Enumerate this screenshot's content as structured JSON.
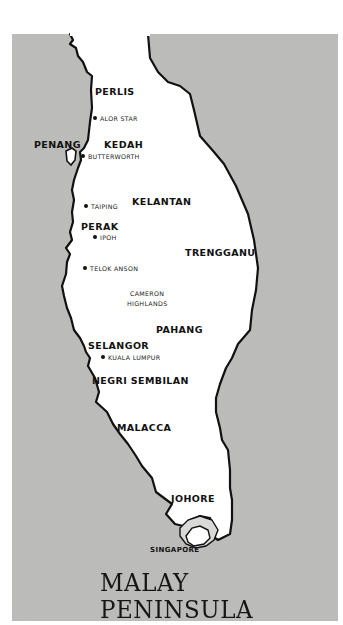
{
  "map": {
    "title": "MALAY PENINSULA",
    "colors": {
      "sea": "#b9b9b7",
      "land": "#ffffff",
      "coastline": "#111111",
      "text": "#111111"
    },
    "states": [
      {
        "name": "PERLIS"
      },
      {
        "name": "KEDAH"
      },
      {
        "name": "PENANG"
      },
      {
        "name": "KELANTAN"
      },
      {
        "name": "PERAK"
      },
      {
        "name": "TRENGGANU"
      },
      {
        "name": "PAHANG"
      },
      {
        "name": "SELANGOR"
      },
      {
        "name": "NEGRI SEMBILAN"
      },
      {
        "name": "MALACCA"
      },
      {
        "name": "JOHORE"
      },
      {
        "name": "SINGAPORE"
      }
    ],
    "towns": [
      {
        "name": "ALOR STAR"
      },
      {
        "name": "BUTTERWORTH"
      },
      {
        "name": "TAIPING"
      },
      {
        "name": "IPOH"
      },
      {
        "name": "TELOK ANSON"
      },
      {
        "name": "KUALA LUMPUR"
      }
    ],
    "regions": [
      {
        "name": "CAMERON",
        "name2": "HIGHLANDS"
      }
    ]
  }
}
